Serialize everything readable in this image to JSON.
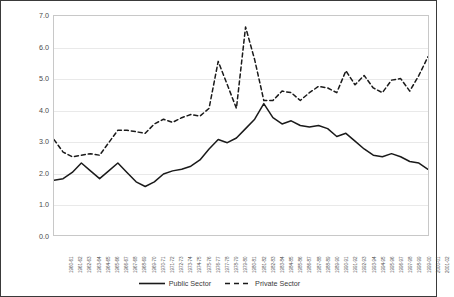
{
  "chart_data": {
    "type": "line",
    "title": "",
    "xlabel": "",
    "ylabel": "in percentages",
    "ylim": [
      0.0,
      7.0
    ],
    "ytick_step": 1.0,
    "ytick_labels": [
      "7.0",
      "6.0",
      "5.0",
      "4.0",
      "3.0",
      "2.0",
      "1.0",
      "0.0"
    ],
    "ytick_values": [
      7.0,
      6.0,
      5.0,
      4.0,
      3.0,
      2.0,
      1.0,
      0.0
    ],
    "grid": "horizontal",
    "legend_position": "bottom-center",
    "categories": [
      "1960-61",
      "1961-62",
      "1962-63",
      "1963-64",
      "1964-65",
      "1965-66",
      "1966-67",
      "1967-68",
      "1968-69",
      "1969-70",
      "1970-71",
      "1971-72",
      "1972-73",
      "1973-74",
      "1974-75",
      "1975-76",
      "1976-77",
      "1977-78",
      "1978-79",
      "1979-80",
      "1980-81",
      "1981-82",
      "1982-83",
      "1983-84",
      "1984-85",
      "1985-86",
      "1986-87",
      "1987-88",
      "1988-89",
      "1989-90",
      "1990-91",
      "1991-92",
      "1992-93",
      "1993-94",
      "1994-95",
      "1995-96",
      "1996-97",
      "1997-98",
      "1998-99",
      "1999-00",
      "2000-01",
      "2001-02"
    ],
    "series": [
      {
        "name": "Public Sector",
        "style": "solid",
        "color": "#1a1a1a",
        "values": [
          1.75,
          1.8,
          2.0,
          2.3,
          2.05,
          1.8,
          2.05,
          2.3,
          2.0,
          1.7,
          1.55,
          1.7,
          1.95,
          2.05,
          2.1,
          2.2,
          2.4,
          2.75,
          3.05,
          2.95,
          3.1,
          3.4,
          3.7,
          4.2,
          3.75,
          3.55,
          3.65,
          3.5,
          3.45,
          3.5,
          3.4,
          3.15,
          3.25,
          3.0,
          2.75,
          2.55,
          2.5,
          2.6,
          2.5,
          2.35,
          2.3,
          2.1
        ]
      },
      {
        "name": "Private Sector",
        "style": "dashed",
        "color": "#1a1a1a",
        "values": [
          3.05,
          2.65,
          2.5,
          2.55,
          2.6,
          2.55,
          2.95,
          3.35,
          3.35,
          3.3,
          3.25,
          3.55,
          3.7,
          3.6,
          3.75,
          3.85,
          3.8,
          4.05,
          5.55,
          4.8,
          4.05,
          6.65,
          5.6,
          4.3,
          4.3,
          4.6,
          4.55,
          4.3,
          4.55,
          4.75,
          4.7,
          4.55,
          5.25,
          4.8,
          5.1,
          4.7,
          4.55,
          4.95,
          5.0,
          4.6,
          5.1,
          5.7
        ]
      }
    ]
  },
  "legend": {
    "items": [
      {
        "label": "Public Sector",
        "style": "solid"
      },
      {
        "label": "Private Sector",
        "style": "dashed"
      }
    ]
  }
}
